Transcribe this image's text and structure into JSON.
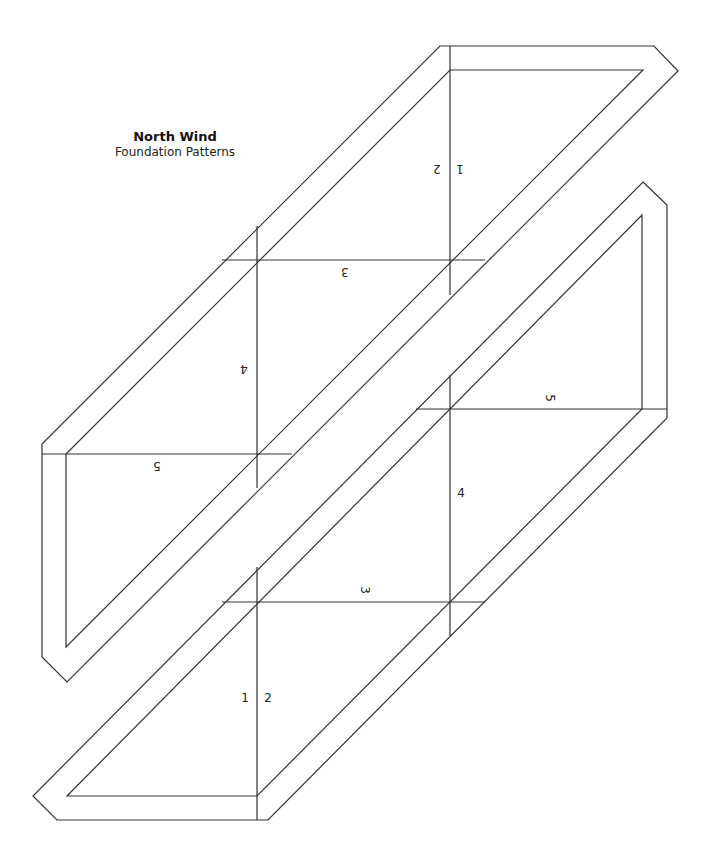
{
  "header": {
    "title": "North Wind",
    "subtitle": "Foundation Patterns"
  },
  "pieces": [
    {
      "name": "upper-left-piece",
      "section_labels": [
        "1",
        "2",
        "3",
        "4",
        "5"
      ],
      "orientation": "rotated 180°"
    },
    {
      "name": "lower-right-piece",
      "section_labels": [
        "1",
        "2",
        "3",
        "4",
        "5"
      ],
      "orientation": "upright (3 and 5 rotated)"
    }
  ],
  "labels": {
    "a1": "1",
    "a2": "2",
    "a3": "3",
    "a4": "4",
    "a5": "5",
    "b1": "1",
    "b2": "2",
    "b3": "3",
    "b4": "4",
    "b5": "5"
  },
  "colors": {
    "line": "#333333",
    "background": "#ffffff"
  }
}
